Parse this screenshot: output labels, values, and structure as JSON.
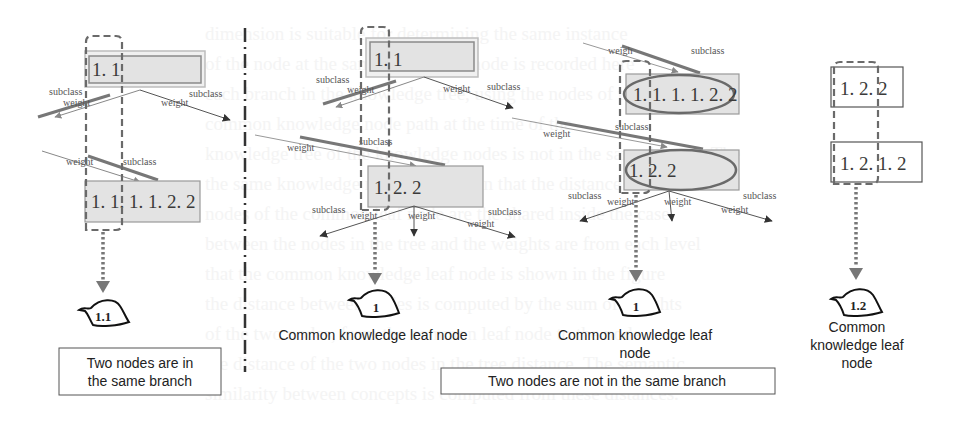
{
  "panels": [
    {
      "id": "panel-1",
      "nodes": [
        {
          "label": "1. 1",
          "x": 85,
          "y": 52,
          "w": 118,
          "h": 32,
          "style": "double"
        },
        {
          "label": "1. 1. 1. 1. 2. 2",
          "x": 85,
          "y": 180,
          "w": 115,
          "h": 40,
          "style": "fill"
        }
      ],
      "edge_labels": [
        {
          "text": "subclass",
          "x": 49,
          "y": 95
        },
        {
          "text": "weight",
          "x": 63,
          "y": 103
        },
        {
          "text": "subclass",
          "x": 189,
          "y": 97
        },
        {
          "text": "weight",
          "x": 161,
          "y": 103
        },
        {
          "text": "weight",
          "x": 66,
          "y": 164
        },
        {
          "text": "subclass",
          "x": 123,
          "y": 164
        }
      ],
      "leaf": {
        "label": "1.1"
      },
      "caption_box": {
        "line1": "Two nodes are in",
        "line2": "the same branch"
      }
    },
    {
      "id": "panel-2",
      "nodes": [
        {
          "label": "1. 1",
          "x": 368,
          "y": 43,
          "w": 104,
          "h": 28,
          "style": "double"
        },
        {
          "label": "1. 2. 2",
          "x": 368,
          "y": 166,
          "w": 114,
          "h": 40,
          "style": "fill"
        }
      ],
      "edge_labels": [
        {
          "text": "subclass",
          "x": 316,
          "y": 83
        },
        {
          "text": "weight",
          "x": 347,
          "y": 93
        },
        {
          "text": "weight",
          "x": 443,
          "y": 92
        },
        {
          "text": "subclass",
          "x": 487,
          "y": 90
        },
        {
          "text": "subclass",
          "x": 359,
          "y": 145
        },
        {
          "text": "weight",
          "x": 287,
          "y": 151
        },
        {
          "text": "subclass",
          "x": 312,
          "y": 213
        },
        {
          "text": "weight",
          "x": 350,
          "y": 219
        },
        {
          "text": "weight",
          "x": 408,
          "y": 219
        },
        {
          "text": "subclass",
          "x": 488,
          "y": 215
        },
        {
          "text": "weight",
          "x": 467,
          "y": 225
        }
      ],
      "leaf": {
        "label": "1"
      },
      "caption": "Common knowledge leaf node"
    },
    {
      "id": "panel-3",
      "nodes": [
        {
          "label": "1. 1. 1. 1. 2. 2",
          "x": 626,
          "y": 74,
          "w": 113,
          "h": 40,
          "style": "ellipse"
        },
        {
          "label": "1. 2. 2",
          "x": 624,
          "y": 150,
          "w": 115,
          "h": 40,
          "style": "ellipse"
        }
      ],
      "edge_labels": [
        {
          "text": "weigh",
          "x": 608,
          "y": 54
        },
        {
          "text": "subclass",
          "x": 691,
          "y": 54
        },
        {
          "text": "weight",
          "x": 543,
          "y": 137
        },
        {
          "text": "subclass",
          "x": 615,
          "y": 130
        },
        {
          "text": "subclass",
          "x": 568,
          "y": 199
        },
        {
          "text": "weight",
          "x": 607,
          "y": 205
        },
        {
          "text": "weight",
          "x": 664,
          "y": 205
        },
        {
          "text": "subclass",
          "x": 743,
          "y": 199
        },
        {
          "text": "weight",
          "x": 721,
          "y": 213
        }
      ],
      "leaf": {
        "label": "1"
      },
      "caption_line1": "Common knowledge leaf",
      "caption_line2": "node",
      "caption_box": "Two nodes are not in the same branch"
    },
    {
      "id": "panel-4",
      "nodes": [
        {
          "label": "1.  2.  2",
          "x": 831,
          "y": 67,
          "w": 72,
          "h": 40,
          "style": "outline"
        },
        {
          "label": "1.  2.  1.  2",
          "x": 831,
          "y": 142,
          "w": 91,
          "h": 40,
          "style": "outline"
        }
      ],
      "leaf": {
        "label": "1.2"
      },
      "caption_line1": "Common",
      "caption_line2": "knowledge leaf",
      "caption_line3": "node"
    }
  ],
  "colors": {
    "node_fill": "#e4e4e4",
    "node_stroke": "#8a8a8a",
    "emphasis_line": "#6f6f6f",
    "dashed_group": "#6a6a6a",
    "ellipse": "#6a6a6a",
    "arrow": "#555555",
    "separator": "#333333",
    "leaf_stroke": "#111111"
  }
}
